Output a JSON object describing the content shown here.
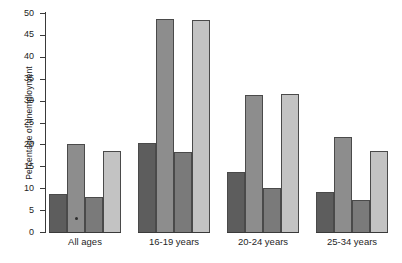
{
  "chart_data": {
    "type": "bar",
    "title": "",
    "subtitle": "",
    "xlabel": "",
    "ylabel": "Percentage of unemployment",
    "categories": [
      "All ages",
      "16-19 years",
      "20-24 years",
      "25-34 years"
    ],
    "series": [
      {
        "name": "series-1",
        "color": "#5d5d5d",
        "values": [
          8.7,
          20.3,
          13.6,
          9.1
        ]
      },
      {
        "name": "series-2",
        "color": "#8d8d8d",
        "values": [
          20.0,
          48.7,
          31.2,
          21.6
        ]
      },
      {
        "name": "series-3",
        "color": "#7a7a7a",
        "values": [
          7.9,
          18.2,
          10.1,
          7.4
        ]
      },
      {
        "name": "series-4",
        "color": "#c3c3c3",
        "values": [
          18.5,
          48.4,
          31.6,
          18.6
        ]
      }
    ],
    "ylim": [
      0,
      50
    ],
    "yticks": [
      0,
      5,
      10,
      15,
      20,
      25,
      30,
      35,
      40,
      45,
      50
    ],
    "ytick_labels": [
      "0",
      "5",
      "10",
      "15",
      "20",
      "25",
      "30",
      "35",
      "40",
      "45",
      "50"
    ],
    "grid": false,
    "legend": false,
    "legend_position": "none",
    "axis_color": "#3a3a3a",
    "background_color": "#ffffff"
  }
}
